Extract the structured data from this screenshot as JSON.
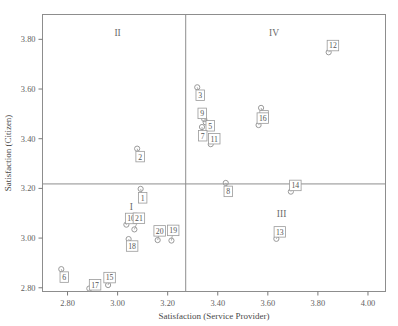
{
  "chart_data": {
    "type": "scatter",
    "title": "",
    "xlabel": "Satisfaction (Service Provider)",
    "ylabel": "Satisfaction (Citizen)",
    "xlim": [
      2.7,
      4.07
    ],
    "ylim": [
      2.785,
      3.9
    ],
    "xticks": [
      "2.80",
      "3.00",
      "3.20",
      "3.40",
      "3.60",
      "3.80",
      "4.00"
    ],
    "xtickvalues": [
      2.8,
      3.0,
      3.2,
      3.4,
      3.6,
      3.8,
      4.0
    ],
    "yticks": [
      "2.80",
      "3.00",
      "3.20",
      "3.40",
      "3.60",
      "3.80"
    ],
    "ytickvalues": [
      2.8,
      3.0,
      3.2,
      3.4,
      3.6,
      3.8
    ],
    "grid": false,
    "legend": "none",
    "quadrant_divider_x": 3.272,
    "quadrant_divider_y": 3.218,
    "quadrant_labels": [
      {
        "text": "II",
        "x": 3.0,
        "y": 3.815
      },
      {
        "text": "IV",
        "x": 3.625,
        "y": 3.815
      },
      {
        "text": "I",
        "x": 3.055,
        "y": 3.115
      },
      {
        "text": "III",
        "x": 3.655,
        "y": 3.085
      }
    ],
    "points": [
      {
        "label": "1",
        "x": 3.092,
        "y": 3.198,
        "lx": 3.1,
        "ly": 3.162
      },
      {
        "label": "2",
        "x": 3.078,
        "y": 3.36,
        "lx": 3.09,
        "ly": 3.328
      },
      {
        "label": "3",
        "x": 3.318,
        "y": 3.607,
        "lx": 3.33,
        "ly": 3.575
      },
      {
        "label": "4",
        "x": 3.573,
        "y": 3.524,
        "lx": 3.585,
        "ly": 3.492
      },
      {
        "label": "5",
        "x": 3.352,
        "y": 3.466,
        "lx": 3.37,
        "ly": 3.452
      },
      {
        "label": "6",
        "x": 2.775,
        "y": 2.875,
        "lx": 2.787,
        "ly": 2.843
      },
      {
        "label": "7",
        "x": 3.337,
        "y": 3.447,
        "lx": 3.34,
        "ly": 3.412
      },
      {
        "label": "8",
        "x": 3.432,
        "y": 3.222,
        "lx": 3.442,
        "ly": 3.188
      },
      {
        "label": "9",
        "x": 3.346,
        "y": 3.479,
        "lx": 3.338,
        "ly": 3.502
      },
      {
        "label": "10",
        "x": 3.035,
        "y": 3.054,
        "lx": 3.054,
        "ly": 3.079
      },
      {
        "label": "11",
        "x": 3.372,
        "y": 3.378,
        "lx": 3.386,
        "ly": 3.4
      },
      {
        "label": "12",
        "x": 3.843,
        "y": 3.748,
        "lx": 3.86,
        "ly": 3.775
      },
      {
        "label": "13",
        "x": 3.634,
        "y": 2.997,
        "lx": 3.648,
        "ly": 3.025
      },
      {
        "label": "14",
        "x": 3.692,
        "y": 3.187,
        "lx": 3.71,
        "ly": 3.212
      },
      {
        "label": "15",
        "x": 2.962,
        "y": 2.811,
        "lx": 2.968,
        "ly": 2.841
      },
      {
        "label": "16",
        "x": 3.563,
        "y": 3.455,
        "lx": 3.58,
        "ly": 3.483
      },
      {
        "label": "17",
        "x": 2.887,
        "y": 2.797,
        "lx": 2.91,
        "ly": 2.812
      },
      {
        "label": "18",
        "x": 3.044,
        "y": 2.996,
        "lx": 3.058,
        "ly": 2.968
      },
      {
        "label": "19",
        "x": 3.215,
        "y": 2.99,
        "lx": 3.222,
        "ly": 3.031
      },
      {
        "label": "20",
        "x": 3.16,
        "y": 2.992,
        "lx": 3.168,
        "ly": 3.029
      },
      {
        "label": "21",
        "x": 3.067,
        "y": 3.035,
        "lx": 3.085,
        "ly": 3.08
      }
    ]
  }
}
